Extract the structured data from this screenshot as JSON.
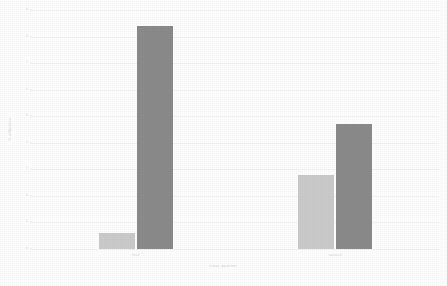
{
  "chart_data": {
    "type": "bar",
    "title": "",
    "subtitle": "",
    "xlabel": "class quarter",
    "ylabel": "% difference",
    "categories": [
      "first",
      "second"
    ],
    "series": [
      {
        "name": "light",
        "color": "#cbcbcb",
        "values": [
          0.6,
          2.8
        ]
      },
      {
        "name": "dark",
        "color": "#8b8b8b",
        "values": [
          8.4,
          4.7
        ]
      }
    ],
    "ylim": [
      0,
      9
    ],
    "ytick_labels": [
      "0",
      "1",
      "2",
      "3",
      "4",
      "5",
      "6",
      "7",
      "8",
      "9"
    ],
    "ytick_values": [
      0,
      1,
      2,
      3,
      4,
      5,
      6,
      7,
      8,
      9
    ],
    "xtick_labels": [
      "first",
      "second"
    ],
    "grid": true,
    "grid_axis": "y",
    "legend": false,
    "legend_position": "none",
    "background": "#ffffff",
    "grid_color": "#f4f4f4",
    "tick_color": "#d4d4d4"
  },
  "figure": {
    "background_color": "#ffffff",
    "width_px": 447,
    "height_px": 286
  }
}
